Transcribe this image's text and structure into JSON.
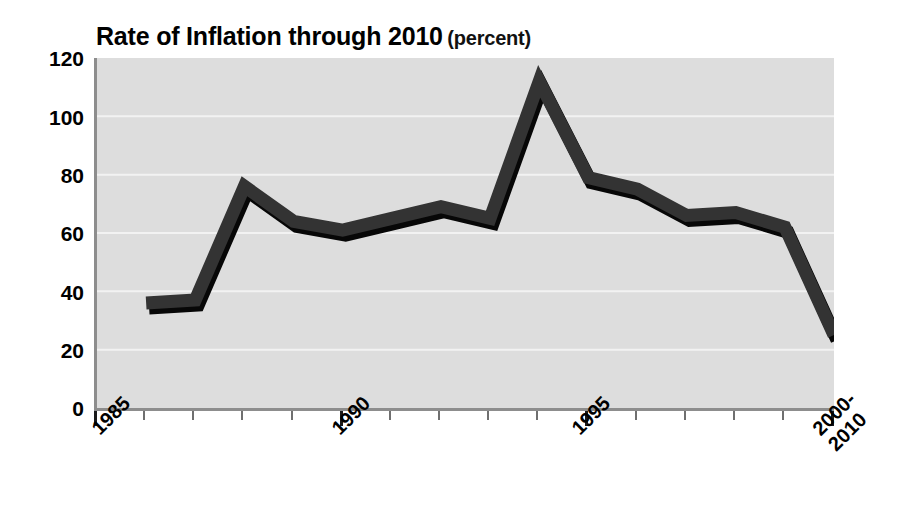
{
  "chart_data": {
    "type": "line",
    "title": "Rate of Inflation through 2010 (percent)",
    "title_main": "Rate of Inflation through 2010",
    "title_unit": "(percent)",
    "xlabel": "",
    "ylabel": "",
    "ylim": [
      0,
      120
    ],
    "ytick_values": [
      0,
      20,
      40,
      60,
      80,
      100,
      120
    ],
    "ytick_labels": [
      "0",
      "20",
      "40",
      "60",
      "80",
      "100",
      "120"
    ],
    "xtick_labels": [
      "1985",
      "1990",
      "1995",
      "2000-\n2010"
    ],
    "xtick_label_lines": [
      [
        "1985"
      ],
      [
        "1990"
      ],
      [
        "1995"
      ],
      [
        "2000-",
        "2010"
      ]
    ],
    "xtick_major_years": [
      1985,
      1990,
      1995,
      2000
    ],
    "x_axis_start_year": 1985,
    "x_axis_end_year": 2000,
    "grid": true,
    "grid_axis": "y",
    "legend": false,
    "legend_position": "none",
    "plot_bgcolor": "#dddddd",
    "line_color": "#333333",
    "shadow_color": "#000000",
    "line_width_px": 13,
    "categories": [
      "1986",
      "1987",
      "1988",
      "1989",
      "1990",
      "1991",
      "1992",
      "1993",
      "1994",
      "1995",
      "1996",
      "1997",
      "1998",
      "1999",
      "2000-2010"
    ],
    "x": [
      1986,
      1987,
      1988,
      1989,
      1990,
      1991,
      1992,
      1993,
      1994,
      1995,
      1996,
      1997,
      1998,
      1999,
      2000
    ],
    "values": [
      36,
      37,
      76,
      64,
      61,
      65,
      69,
      65,
      112,
      79,
      75,
      66,
      67,
      62,
      25
    ],
    "series": [
      {
        "name": "Rate of Inflation",
        "values": [
          36,
          37,
          76,
          64,
          61,
          65,
          69,
          65,
          112,
          79,
          75,
          66,
          67,
          62,
          25
        ]
      }
    ]
  },
  "axis": {
    "y_label_color": "#000000",
    "axis_line_color": "#8d8d8d"
  }
}
